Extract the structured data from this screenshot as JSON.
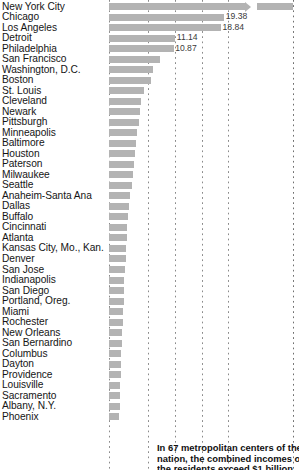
{
  "chart_data": {
    "type": "bar",
    "title": "",
    "subtitle": "",
    "xlabel": "",
    "ylabel": "",
    "orientation": "horizontal",
    "grid": true,
    "gridline_values": [
      0,
      5,
      10,
      15,
      20
    ],
    "xlim": [
      0,
      20
    ],
    "legend": "none",
    "note": "Top bar extends beyond the axis and is drawn with a break arrow.",
    "categories": [
      "New York City",
      "Chicago",
      "Los Angeles",
      "Detroit",
      "Philadelphia",
      "San Francisco",
      "Washington, D.C.",
      "Boston",
      "St. Louis",
      "Cleveland",
      "Newark",
      "Pittsburgh",
      "Minneapolis",
      "Baltimore",
      "Houston",
      "Paterson",
      "Milwaukee",
      "Seattle",
      "Anaheim-Santa Ana",
      "Dallas",
      "Buffalo",
      "Cincinnati",
      "Atlanta",
      "Kansas City, Mo., Kan.",
      "Denver",
      "San Jose",
      "Indianapolis",
      "San Diego",
      "Portland, Oreg.",
      "Miami",
      "Rochester",
      "New Orleans",
      "San Bernardino",
      "Columbus",
      "Dayton",
      "Providence",
      "Louisville",
      "Sacramento",
      "Albany, N.Y.",
      "Phoenix"
    ],
    "values": [
      41.5,
      19.38,
      18.84,
      11.14,
      10.87,
      8.6,
      7.4,
      7.1,
      5.9,
      5.4,
      5.2,
      5.0,
      4.7,
      4.6,
      4.4,
      4.2,
      4.0,
      3.8,
      3.6,
      3.4,
      3.25,
      3.1,
      3.0,
      2.9,
      2.8,
      2.7,
      2.6,
      2.55,
      2.45,
      2.4,
      2.3,
      2.25,
      2.15,
      2.05,
      2.0,
      1.95,
      1.9,
      1.85,
      1.8,
      1.75
    ],
    "value_labels": [
      "",
      "19.38",
      "18.84",
      "11.14",
      "10.87",
      "",
      "",
      "",
      "",
      "",
      "",
      "",
      "",
      "",
      "",
      "",
      "",
      "",
      "",
      "",
      "",
      "",
      "",
      "",
      "",
      "",
      "",
      "",
      "",
      "",
      "",
      "",
      "",
      "",
      "",
      "",
      "",
      "",
      "",
      ""
    ],
    "bar_color": "#b3b3b3"
  },
  "caption": {
    "line1": "In 67 metropolitan centers of the",
    "line2": "nation, the combined incomes of",
    "line3": "the residents exceed $1 billion"
  }
}
